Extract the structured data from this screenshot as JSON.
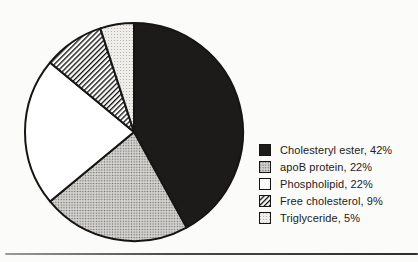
{
  "colors": {
    "ink": "#1c1b1a",
    "outline": "#161514",
    "background": "#fbfbf9",
    "halftone_medium_bg": "#d7d6d3",
    "halftone_medium_dot": "#6e6d6a",
    "halftone_light_bg": "#efeeea",
    "halftone_light_dot": "#aeada9",
    "text": "#222120"
  },
  "chart_data": {
    "type": "pie",
    "title": "",
    "start_angle_deg": 0,
    "direction": "clockwise",
    "legend_position": "right",
    "grid": false,
    "categories": [
      "Cholesteryl ester",
      "apoB protein",
      "Phospholipid",
      "Free cholesterol",
      "Triglyceride"
    ],
    "values": [
      42,
      22,
      22,
      9,
      5
    ],
    "slices": [
      {
        "label": "Cholesteryl ester",
        "value": 42,
        "pattern": "solid-black",
        "legend_label": "Cholesteryl ester, 42%"
      },
      {
        "label": "apoB protein",
        "value": 22,
        "pattern": "halftone-medium",
        "legend_label": "apoB protein, 22%"
      },
      {
        "label": "Phospholipid",
        "value": 22,
        "pattern": "white",
        "legend_label": "Phospholipid, 22%"
      },
      {
        "label": "Free cholesterol",
        "value": 9,
        "pattern": "diagonal-hatch",
        "legend_label": "Free cholesterol, 9%"
      },
      {
        "label": "Triglyceride",
        "value": 5,
        "pattern": "halftone-light",
        "legend_label": "Triglyceride, 5%"
      }
    ]
  }
}
